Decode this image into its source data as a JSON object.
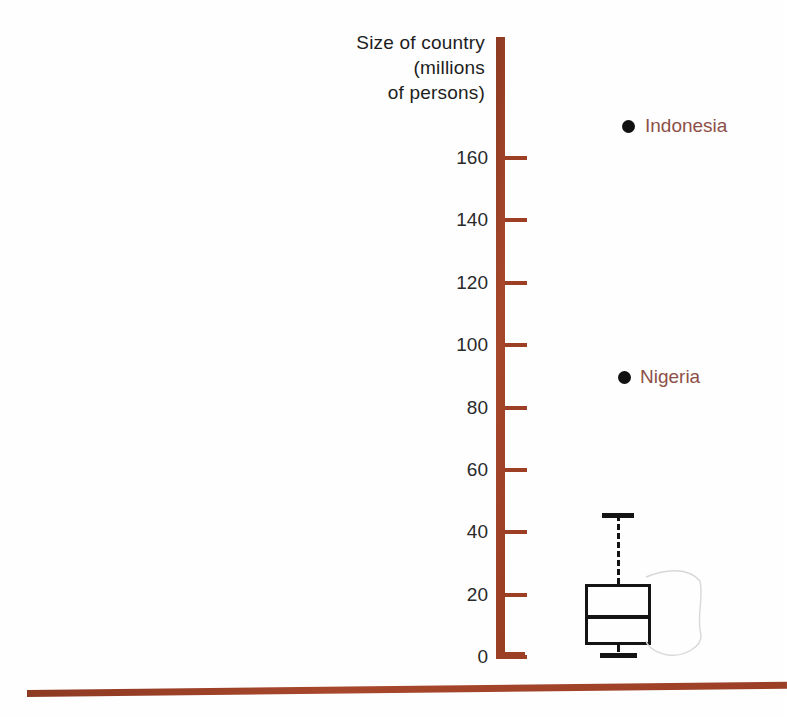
{
  "chart_data": {
    "type": "box",
    "title": "Size of country (millions of persons)",
    "axis_title_lines": [
      "Size of country",
      "(millions",
      "of persons)"
    ],
    "xlabel": "",
    "ylabel": "Size of country (millions of persons)",
    "ylim": [
      0,
      160
    ],
    "ytick_step": 20,
    "yticks": [
      0,
      20,
      40,
      60,
      80,
      100,
      120,
      140,
      160
    ],
    "ytick_labels": [
      "0",
      "20",
      "40",
      "60",
      "80",
      "100",
      "120",
      "140",
      "160"
    ],
    "grid": false,
    "legend": "none",
    "orientation": "vertical",
    "box": {
      "name": "Country population",
      "whisker_low": 1.6,
      "q1": 3.8,
      "median": 12.8,
      "q3": 23.4,
      "whisker_high": 45.5
    },
    "outliers": [
      {
        "label": "Indonesia",
        "value": 170
      },
      {
        "label": "Nigeria",
        "value": 90
      }
    ],
    "colors": {
      "axis": "#9c3f25",
      "baseline": "#9c3f25",
      "box_outline": "#141414",
      "outlier_dot": "#111111",
      "outlier_label": "#8d5048",
      "tick_label": "#2a2a2a",
      "axis_title": "#1d1d1d",
      "background": "#fefefe"
    }
  },
  "ticks": [
    {
      "label": "160",
      "value": 160
    },
    {
      "label": "140",
      "value": 140
    },
    {
      "label": "120",
      "value": 120
    },
    {
      "label": "100",
      "value": 100
    },
    {
      "label": "80",
      "value": 80
    },
    {
      "label": "60",
      "value": 60
    },
    {
      "label": "40",
      "value": 40
    },
    {
      "label": "20",
      "value": 20
    },
    {
      "label": "0",
      "value": 0
    }
  ],
  "axis_title": {
    "line1": "Size of country",
    "line2": "(millions",
    "line3": "of persons)"
  },
  "outliers": [
    {
      "label": "Indonesia"
    },
    {
      "label": "Nigeria"
    }
  ]
}
